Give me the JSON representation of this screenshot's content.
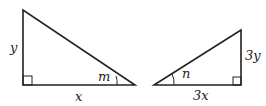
{
  "diagram": {
    "left_triangle": {
      "side_vertical": "y",
      "side_horizontal": "x",
      "angle": "m",
      "right_angle": true
    },
    "right_triangle": {
      "side_vertical": "3y",
      "side_horizontal": "3x",
      "angle": "n",
      "right_angle": true
    },
    "colors": {
      "stroke": "#222222",
      "background": "#ffffff"
    }
  }
}
